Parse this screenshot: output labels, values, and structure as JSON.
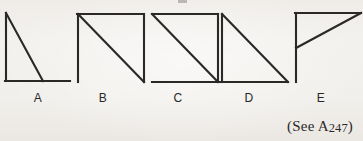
{
  "page": {
    "width": 363,
    "height": 141,
    "background_color": "#f2f0ec",
    "ink_color": "#2b2927"
  },
  "figures": [
    {
      "id": "figure-a",
      "label": "A",
      "label_x": 38,
      "label_y": 92,
      "strokes": [
        {
          "name": "left-vertical",
          "x1": 6,
          "y1": 13,
          "x2": 6,
          "y2": 81
        },
        {
          "name": "bottom-horizontal",
          "x1": 5,
          "y1": 81,
          "x2": 70,
          "y2": 81
        },
        {
          "name": "diagonal",
          "x1": 6,
          "y1": 13,
          "x2": 43,
          "y2": 81
        }
      ]
    },
    {
      "id": "figure-b",
      "label": "B",
      "label_x": 103,
      "label_y": 92,
      "strokes": [
        {
          "name": "left-vertical",
          "x1": 78,
          "y1": 14,
          "x2": 78,
          "y2": 82
        },
        {
          "name": "top-horizontal",
          "x1": 77,
          "y1": 14,
          "x2": 144,
          "y2": 14
        },
        {
          "name": "right-vertical",
          "x1": 144,
          "y1": 14,
          "x2": 144,
          "y2": 82
        },
        {
          "name": "diagonal",
          "x1": 78,
          "y1": 14,
          "x2": 144,
          "y2": 82
        }
      ]
    },
    {
      "id": "figure-c",
      "label": "C",
      "label_x": 178,
      "label_y": 92,
      "strokes": [
        {
          "name": "top-horizontal",
          "x1": 152,
          "y1": 14,
          "x2": 218,
          "y2": 14
        },
        {
          "name": "right-vertical",
          "x1": 218,
          "y1": 14,
          "x2": 218,
          "y2": 82
        },
        {
          "name": "bottom-horizontal",
          "x1": 152,
          "y1": 82,
          "x2": 219,
          "y2": 82
        },
        {
          "name": "diagonal",
          "x1": 152,
          "y1": 14,
          "x2": 218,
          "y2": 82
        }
      ]
    },
    {
      "id": "figure-d",
      "label": "D",
      "label_x": 249,
      "label_y": 92,
      "strokes": [
        {
          "name": "left-vertical",
          "x1": 222,
          "y1": 14,
          "x2": 222,
          "y2": 82
        },
        {
          "name": "bottom-horizontal",
          "x1": 221,
          "y1": 82,
          "x2": 288,
          "y2": 82
        },
        {
          "name": "diagonal",
          "x1": 222,
          "y1": 14,
          "x2": 288,
          "y2": 82
        }
      ]
    },
    {
      "id": "figure-e",
      "label": "E",
      "label_x": 321,
      "label_y": 92,
      "strokes": [
        {
          "name": "left-vertical",
          "x1": 296,
          "y1": 13,
          "x2": 296,
          "y2": 82
        },
        {
          "name": "top-horizontal",
          "x1": 295,
          "y1": 13,
          "x2": 361,
          "y2": 13
        },
        {
          "name": "diagonal",
          "x1": 296,
          "y1": 48,
          "x2": 361,
          "y2": 13
        }
      ]
    }
  ],
  "caption": {
    "open_paren": "(",
    "see_text": "See A",
    "reference_number": "247",
    "close_paren": ")",
    "full_text": "(See A247)"
  }
}
